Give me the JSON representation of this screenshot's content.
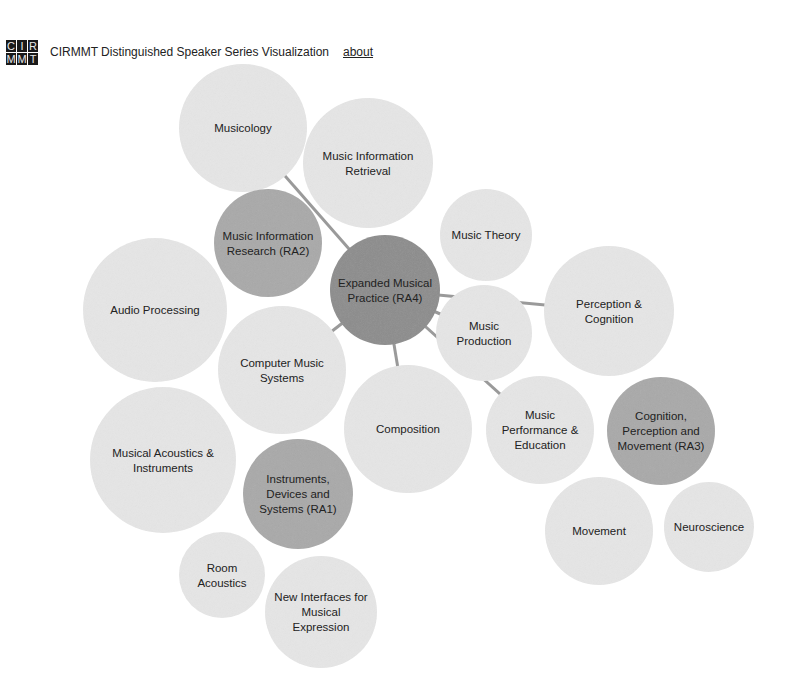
{
  "header": {
    "logo_letters": [
      "C",
      "I",
      "R",
      "M",
      "M",
      "T"
    ],
    "title": "CIRMMT Distinguished Speaker Series Visualization",
    "about_link": "about"
  },
  "colors": {
    "topic_fill": "#e6e6e6",
    "area_fill": "#a9a9a9",
    "center_fill": "#8c8c8c",
    "link_stroke": "#9a9a9a"
  },
  "nodes": [
    {
      "id": "musicology",
      "lines": [
        "Musicology"
      ],
      "type": "topic"
    },
    {
      "id": "mir",
      "lines": [
        "Music Information",
        "Retrieval"
      ],
      "type": "topic"
    },
    {
      "id": "music-theory",
      "lines": [
        "Music Theory"
      ],
      "type": "topic"
    },
    {
      "id": "ra2",
      "lines": [
        "Music Information",
        "Research (RA2)"
      ],
      "type": "area"
    },
    {
      "id": "ra4",
      "lines": [
        "Expanded Musical",
        "Practice (RA4)"
      ],
      "type": "center"
    },
    {
      "id": "audio-processing",
      "lines": [
        "Audio Processing"
      ],
      "type": "topic"
    },
    {
      "id": "perception-cognition",
      "lines": [
        "Perception &",
        "Cognition"
      ],
      "type": "topic"
    },
    {
      "id": "music-production",
      "lines": [
        "Music",
        "Production"
      ],
      "type": "topic"
    },
    {
      "id": "computer-music-systems",
      "lines": [
        "Computer Music",
        "Systems"
      ],
      "type": "topic"
    },
    {
      "id": "composition",
      "lines": [
        "Composition"
      ],
      "type": "topic"
    },
    {
      "id": "music-performance-education",
      "lines": [
        "Music",
        "Performance &",
        "Education"
      ],
      "type": "topic"
    },
    {
      "id": "ra3",
      "lines": [
        "Cognition,",
        "Perception and",
        "Movement (RA3)"
      ],
      "type": "area"
    },
    {
      "id": "musical-acoustics",
      "lines": [
        "Musical Acoustics &",
        "Instruments"
      ],
      "type": "topic"
    },
    {
      "id": "ra1",
      "lines": [
        "Instruments,",
        "Devices and",
        "Systems (RA1)"
      ],
      "type": "area"
    },
    {
      "id": "movement",
      "lines": [
        "Movement"
      ],
      "type": "topic"
    },
    {
      "id": "neuroscience",
      "lines": [
        "Neuroscience"
      ],
      "type": "topic"
    },
    {
      "id": "room-acoustics",
      "lines": [
        "Room",
        "Acoustics"
      ],
      "type": "topic"
    },
    {
      "id": "nime",
      "lines": [
        "New Interfaces for",
        "Musical",
        "Expression"
      ],
      "type": "topic"
    }
  ],
  "links": [
    {
      "source": "ra4",
      "target": "musicology"
    },
    {
      "source": "ra4",
      "target": "music-production"
    },
    {
      "source": "ra4",
      "target": "computer-music-systems"
    },
    {
      "source": "ra4",
      "target": "composition"
    },
    {
      "source": "ra4",
      "target": "music-performance-education"
    },
    {
      "source": "ra4",
      "target": "perception-cognition"
    }
  ]
}
